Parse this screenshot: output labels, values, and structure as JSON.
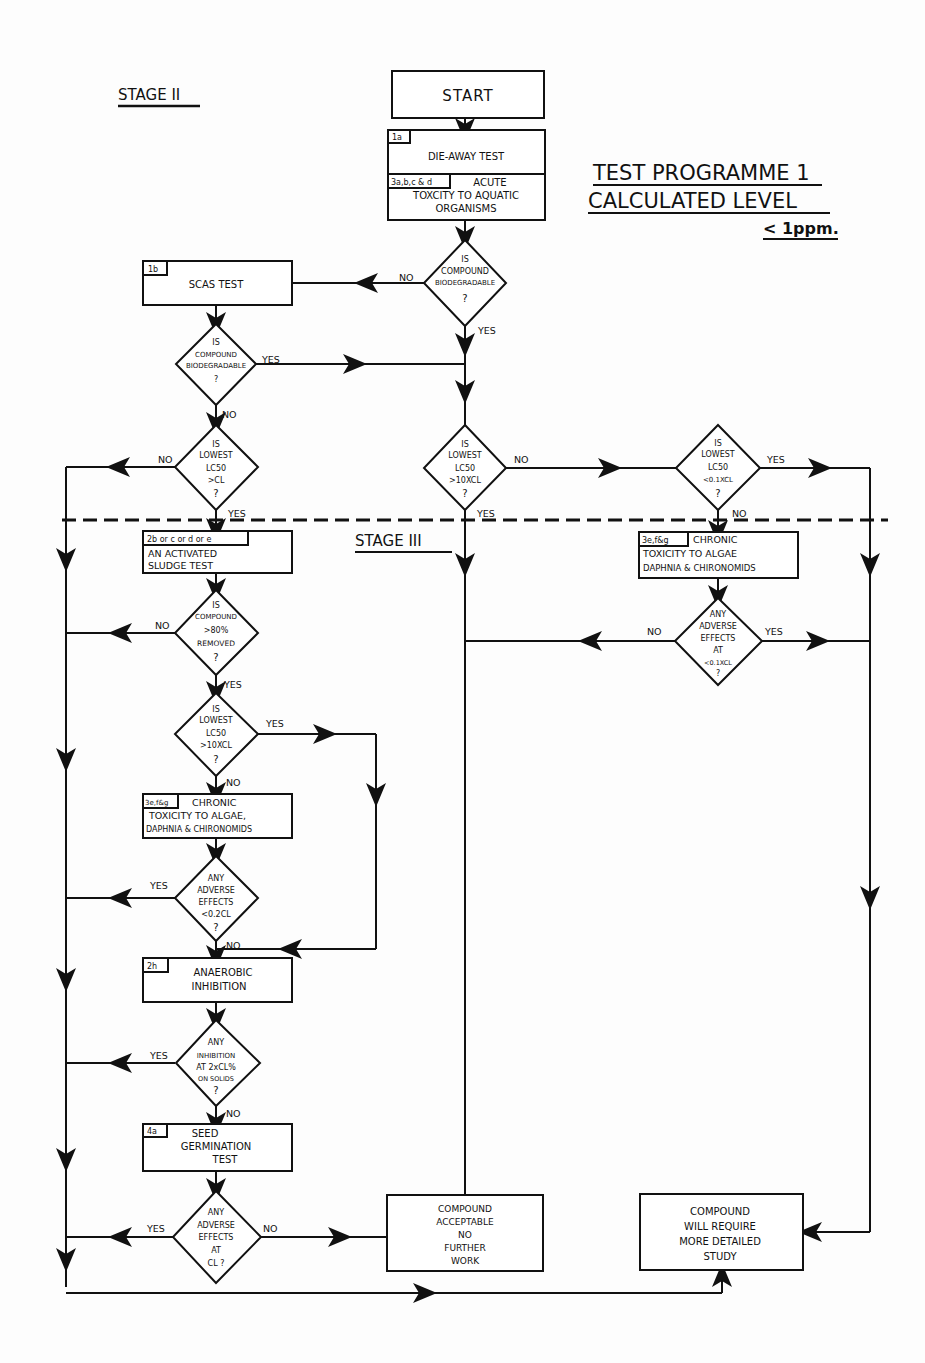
{
  "title": {
    "line1": "TEST PROGRAMME 1",
    "line2": "CALCULATED LEVEL",
    "line3": "< 1ppm."
  },
  "stages": {
    "stage2": "STAGE II",
    "stage3": "STAGE III"
  },
  "nodes": {
    "start": {
      "label": "START"
    },
    "dieaway": {
      "tag": "1a",
      "label": "DIE-AWAY TEST"
    },
    "acute": {
      "tag": "3a,b,c & d",
      "line1": "ACUTE",
      "line2": "TOXCITY TO AQUATIC",
      "line3": "ORGANISMS"
    },
    "q_biodeg1": {
      "line1": "IS",
      "line2": "COMPOUND",
      "line3": "BIODEGRADABLE",
      "line4": "?"
    },
    "scas": {
      "tag": "1b",
      "label": "SCAS TEST"
    },
    "q_biodeg2": {
      "line1": "IS",
      "line2": "COMPOUND",
      "line3": "BIODEGRADABLE",
      "line4": "?"
    },
    "q_lc50_cl": {
      "line1": "IS",
      "line2": "LOWEST",
      "line3": "LC50",
      "line4": ">CL",
      "line5": "?"
    },
    "q_lc50_10cl_mid": {
      "line1": "IS",
      "line2": "LOWEST",
      "line3": "LC50",
      "line4": ">10XCL",
      "line5": "?"
    },
    "q_lc50_01cl": {
      "line1": "IS",
      "line2": "LOWEST",
      "line3": "LC50",
      "line4": "<0.1XCL",
      "line5": "?"
    },
    "sludge": {
      "tag": "2b or c or d or e",
      "line1": "AN ACTIVATED",
      "line2": "SLUDGE TEST"
    },
    "chronic_right": {
      "tag": "3e,f&g",
      "line1": "CHRONIC",
      "line2": "TOXICITY TO ALGAE",
      "line3": "DAPHNIA & CHIRONOMIDS"
    },
    "q_adverse_01cl": {
      "line1": "ANY",
      "line2": "ADVERSE",
      "line3": "EFFECTS",
      "line4": "AT",
      "line5": "<0.1XCL",
      "line6": "?"
    },
    "q_removed": {
      "line1": "IS",
      "line2": "COMPOUND",
      "line3": ">80%",
      "line4": "REMOVED",
      "line5": "?"
    },
    "q_lc50_10cl_left": {
      "line1": "IS",
      "line2": "LOWEST",
      "line3": "LC50",
      "line4": ">10XCL",
      "line5": "?"
    },
    "chronic_left": {
      "tag": "3e,f&g",
      "line1": "CHRONIC",
      "line2": "TOXICITY TO ALGAE,",
      "line3": "DAPHNIA & CHIRONOMIDS"
    },
    "q_adverse_02cl": {
      "line1": "ANY",
      "line2": "ADVERSE",
      "line3": "EFFECTS",
      "line4": "<0.2CL",
      "line5": "?"
    },
    "anaerobic": {
      "tag": "2h",
      "line1": "ANAEROBIC",
      "line2": "INHIBITION"
    },
    "q_inhibition": {
      "line1": "ANY",
      "line2": "INHIBITION",
      "line3": "AT 2xCL%",
      "line4": "ON SOLIDS",
      "line5": "?"
    },
    "seed": {
      "tag": "4a",
      "line1": "SEED",
      "line2": "GERMINATION",
      "line3": "TEST"
    },
    "q_adverse_cl": {
      "line1": "ANY",
      "line2": "ADVERSE",
      "line3": "EFFECTS",
      "line4": "AT",
      "line5": "CL ?"
    },
    "acceptable": {
      "line1": "COMPOUND",
      "line2": "ACCEPTABLE",
      "line3": "NO",
      "line4": "FURTHER",
      "line5": "WORK"
    },
    "detailed": {
      "line1": "COMPOUND",
      "line2": "WILL REQUIRE",
      "line3": "MORE DETAILED",
      "line4": "STUDY"
    }
  },
  "edge_labels": {
    "yes": "YES",
    "no": "NO"
  }
}
